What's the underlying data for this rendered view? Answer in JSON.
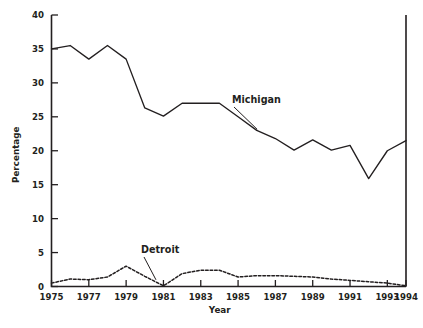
{
  "chart_data": {
    "type": "line",
    "title": "",
    "xlabel": "Year",
    "ylabel": "Percentage",
    "xlim": [
      1975,
      1994
    ],
    "ylim": [
      0,
      40
    ],
    "grid": false,
    "legend_position": "inline-annotations",
    "x": [
      1975,
      1976,
      1977,
      1978,
      1979,
      1980,
      1981,
      1982,
      1983,
      1984,
      1985,
      1986,
      1987,
      1988,
      1989,
      1990,
      1991,
      1992,
      1993,
      1994
    ],
    "xticks": [
      1975,
      1977,
      1979,
      1981,
      1983,
      1985,
      1987,
      1989,
      1991,
      1993,
      1994
    ],
    "xticklabels": [
      "1975",
      "1977",
      "1979",
      "1981",
      "1983",
      "1985",
      "1987",
      "1989",
      "1991",
      "1993",
      "1994"
    ],
    "yticks": [
      0,
      5,
      10,
      15,
      20,
      25,
      30,
      35,
      40
    ],
    "yticklabels": [
      "0",
      "5",
      "10",
      "15",
      "20",
      "25",
      "30",
      "35",
      "40"
    ],
    "series": [
      {
        "name": "Michigan",
        "style": "solid",
        "label_text": "Michigan",
        "values": [
          35.0,
          35.5,
          33.5,
          35.5,
          33.5,
          26.3,
          25.1,
          27.0,
          27.0,
          27.0,
          25.0,
          23.0,
          21.8,
          20.1,
          21.6,
          20.1,
          20.8,
          15.9,
          20.0,
          21.5
        ]
      },
      {
        "name": "Detroit",
        "style": "dashed",
        "label_text": "Detroit",
        "values": [
          0.5,
          1.1,
          1.0,
          1.4,
          3.0,
          1.5,
          0.1,
          1.9,
          2.4,
          2.4,
          1.4,
          1.6,
          1.6,
          1.5,
          1.4,
          1.1,
          0.9,
          0.7,
          0.5,
          0.1
        ]
      }
    ],
    "annotations": [
      {
        "text": "Michigan",
        "series": "Michigan",
        "near_year": 1986
      },
      {
        "text": "Detroit",
        "series": "Detroit",
        "near_year": 1982
      }
    ],
    "colors": {
      "line": "#231f20",
      "background": "#ffffff"
    }
  }
}
